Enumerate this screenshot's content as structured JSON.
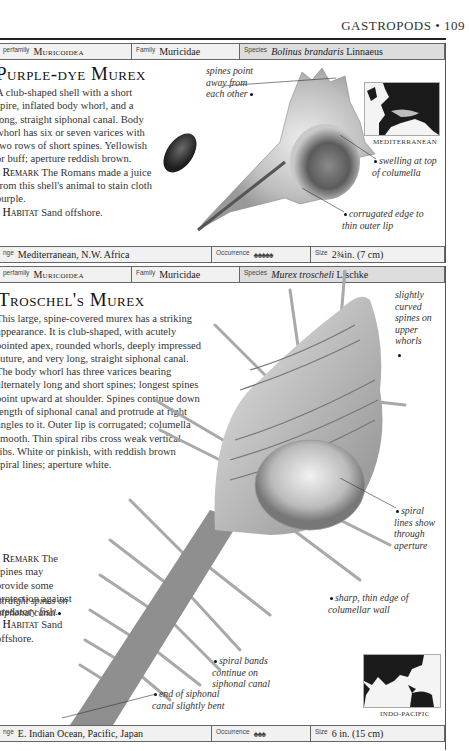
{
  "page": {
    "running_head": "GASTROPODS",
    "page_number": "109"
  },
  "entries": [
    {
      "id": "purple-dye-murex",
      "table_top": {
        "superfamily_label": "perfamily",
        "superfamily": "Muricoidea",
        "family_label": "Family",
        "family": "Muricidae",
        "species_label": "Species",
        "species_genus": "Bolinus brandaris",
        "species_author": "Linnaeus"
      },
      "title": "Purple-dye Murex",
      "description": "A club-shaped shell with a short spire, inflated body whorl, and a long, straight siphonal canal. Body whorl has six or seven varices with two rows of short spines. Yellowish or buff; aperture reddish brown.",
      "remark_label": "Remark",
      "remark": "The Romans made a juice from this shell's animal to stain cloth purple.",
      "habitat_label": "Habitat",
      "habitat": "Sand offshore.",
      "annotations": [
        "spines point away from each other",
        "swelling at top of columella",
        "corrugated edge to thin outer lip"
      ],
      "map_label": "MEDITERRANEAN",
      "table_bottom": {
        "range_label": "nge",
        "range": "Mediterranean, N.W. Africa",
        "occurrence_label": "Occurrence",
        "occurrence_icons": "♠♠♠♠♠",
        "occurrence_count": 5,
        "size_label": "Size",
        "size": "2¾in. (7 cm)"
      }
    },
    {
      "id": "troschels-murex",
      "table_top": {
        "superfamily_label": "perfamily",
        "superfamily": "Muricoidea",
        "family_label": "Family",
        "family": "Muricidae",
        "species_label": "Species",
        "species_genus": "Murex troscheli",
        "species_author": "Lischke"
      },
      "title": "Troschel's Murex",
      "description": "This large, spine-covered murex has a striking appearance. It is club-shaped, with acutely pointed apex, rounded whorls, deeply impressed suture, and very long, straight siphonal canal. The body whorl has three varices bearing alternately long and short spines; longest spines point upward at shoulder. Spines continue down length of siphonal canal and protrude at right angles to it. Outer lip is corrugated; columella smooth. Thin spiral ribs cross weak vertical ribs. White or pinkish, with reddish brown spiral lines; aperture white.",
      "remark_label": "Remark",
      "remark": "The spines may provide some protection against predatory fish.",
      "habitat_label": "Habitat",
      "habitat": "Sand offshore.",
      "annotations": [
        "slightly curved spines on upper whorls",
        "spiral lines show through aperture",
        "sharp, thin edge of columellar wall",
        "straight spines on siphonal canal",
        "spiral bands continue on siphonal canal",
        "end of siphonal canal slightly bent"
      ],
      "map_label": "INDO-PACIFIC",
      "table_bottom": {
        "range_label": "nge",
        "range": "E. Indian Ocean, Pacific, Japan",
        "occurrence_label": "Occurrence",
        "occurrence_icons": "♠♠♠",
        "occurrence_count": 3,
        "size_label": "Size",
        "size": "6 in. (15 cm)"
      }
    }
  ]
}
